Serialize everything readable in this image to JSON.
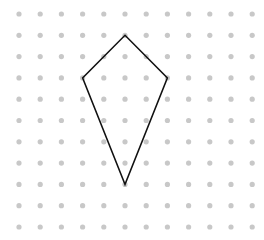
{
  "diagram": {
    "type": "dot-grid-shape",
    "shape_name": "kite",
    "background": "#ffffff",
    "grid": {
      "columns": 12,
      "rows": 11,
      "origin_x": 19,
      "origin_y": 14,
      "spacing_x": 21.2,
      "spacing_y": 21.3,
      "dot_radius": 2.6,
      "dot_color": "#c8c8c8"
    },
    "shape": {
      "stroke": "#111111",
      "stroke_width": 1.5,
      "vertices_grid": [
        [
          5,
          1
        ],
        [
          7,
          3
        ],
        [
          5,
          8
        ],
        [
          3,
          3
        ]
      ]
    }
  }
}
